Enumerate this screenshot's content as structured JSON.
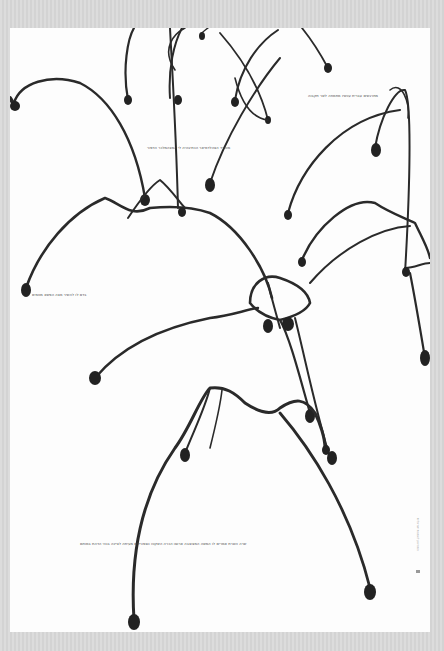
{
  "poster": {
    "background": "#fdfdfd",
    "frame_color": "#d9d9d9",
    "ink_color": "#2a2a2a",
    "captions": [
      {
        "id": "caption-top-right",
        "text": "מתרגשים עברית עכשיו מתמחה לשר תקבוה",
        "x": 298,
        "y": 66
      },
      {
        "id": "caption-upper-middle",
        "text": "מטורד הצהלדמיאר הכתיבהיה לי המצהמלכר הדפור",
        "x": 137,
        "y": 118
      },
      {
        "id": "caption-left",
        "text": "בדם לו להשיר מצה הפשא מטמים",
        "x": 22,
        "y": 265
      },
      {
        "id": "caption-bottom",
        "text": "שרה השרת אמרים לו המשה המצוצבה ארוסו הכרה השקטו כספורלים מעיתה לציינה בנהי הדהת במותם",
        "x": 70,
        "y": 514
      }
    ],
    "side_credit": "המוזיאון לאמנות ישראלית"
  }
}
